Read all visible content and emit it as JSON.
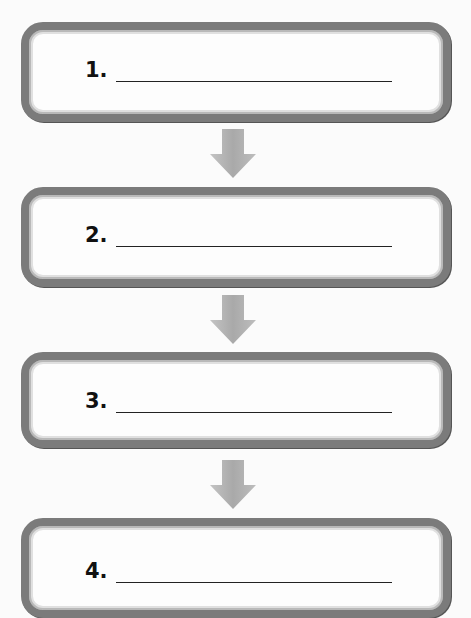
{
  "diagram": {
    "type": "vertical-flowchart",
    "steps": [
      {
        "label": "1.",
        "value": ""
      },
      {
        "label": "2.",
        "value": ""
      },
      {
        "label": "3.",
        "value": ""
      },
      {
        "label": "4.",
        "value": ""
      }
    ],
    "connectors": [
      {
        "from": 1,
        "to": 2,
        "icon": "down-arrow-icon"
      },
      {
        "from": 2,
        "to": 3,
        "icon": "down-arrow-icon"
      },
      {
        "from": 3,
        "to": 4,
        "icon": "down-arrow-icon"
      }
    ],
    "colors": {
      "box_border": "#7b7b7b",
      "arrow_fill": "#b3b3b3",
      "text": "#111111",
      "background": "#fbfbfb"
    }
  }
}
